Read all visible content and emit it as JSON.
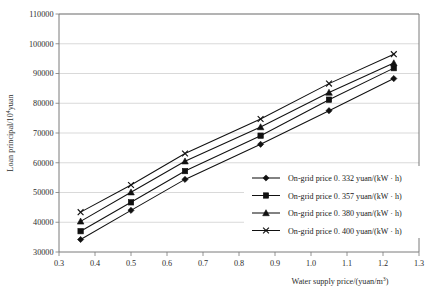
{
  "chart_data": {
    "type": "line",
    "title": "",
    "xlabel": "Water supply price/(yuan/m³)",
    "ylabel": "Loan  principal/10⁴yuan",
    "ylabel_main": "Loan  principal/10",
    "ylabel_sup": "4",
    "ylabel_tail": "yuan",
    "xlabel_main": "Water supply price/(yuan/m",
    "xlabel_sup": "3",
    "xlabel_tail": ")",
    "xlim": [
      0.3,
      1.3
    ],
    "ylim": [
      30000,
      110000
    ],
    "xticks": [
      "0.3",
      "0.4",
      "0.5",
      "0.6",
      "0.7",
      "0.8",
      "0.9",
      "1.0",
      "1.1",
      "1.2",
      "1.3"
    ],
    "xtick_values": [
      0.3,
      0.4,
      0.5,
      0.6,
      0.7,
      0.8,
      0.9,
      1.0,
      1.1,
      1.2,
      1.3
    ],
    "yticks": [
      "30000",
      "40000",
      "50000",
      "60000",
      "70000",
      "80000",
      "90000",
      "100000",
      "110000"
    ],
    "ytick_values": [
      30000,
      40000,
      50000,
      60000,
      70000,
      80000,
      90000,
      100000,
      110000
    ],
    "grid": true,
    "legend_position": "inside-right-lower",
    "x": [
      0.36,
      0.5,
      0.65,
      0.86,
      1.05,
      1.23
    ],
    "series": [
      {
        "name": "On-grid price 0. 332  yuan/(kW · h)",
        "price": "0. 332",
        "marker": "diamond",
        "values": [
          34200,
          44000,
          54400,
          66200,
          77500,
          88300
        ]
      },
      {
        "name": "On-grid price 0. 357  yuan/(kW · h)",
        "price": "0. 357",
        "marker": "square",
        "values": [
          37000,
          46700,
          57200,
          69100,
          81200,
          91800
        ]
      },
      {
        "name": "On-grid price 0. 380  yuan/(kW · h)",
        "price": "0. 380",
        "marker": "triangle",
        "values": [
          40300,
          50100,
          60500,
          72000,
          83600,
          93500
        ]
      },
      {
        "name": "On-grid price 0. 400  yuan/(kW · h)",
        "price": "0. 400",
        "marker": "cross",
        "values": [
          43400,
          52500,
          63100,
          74700,
          86600,
          96500
        ]
      }
    ],
    "legend": [
      "On-grid price 0. 332  yuan/(kW · h)",
      "On-grid price 0. 357  yuan/(kW · h)",
      "On-grid price 0. 380  yuan/(kW · h)",
      "On-grid price 0. 400  yuan/(kW · h)"
    ],
    "colors": {
      "line": "#111111",
      "grid": "#c8c8c8",
      "axis": "#7a7a7a",
      "background": "#ffffff"
    }
  }
}
